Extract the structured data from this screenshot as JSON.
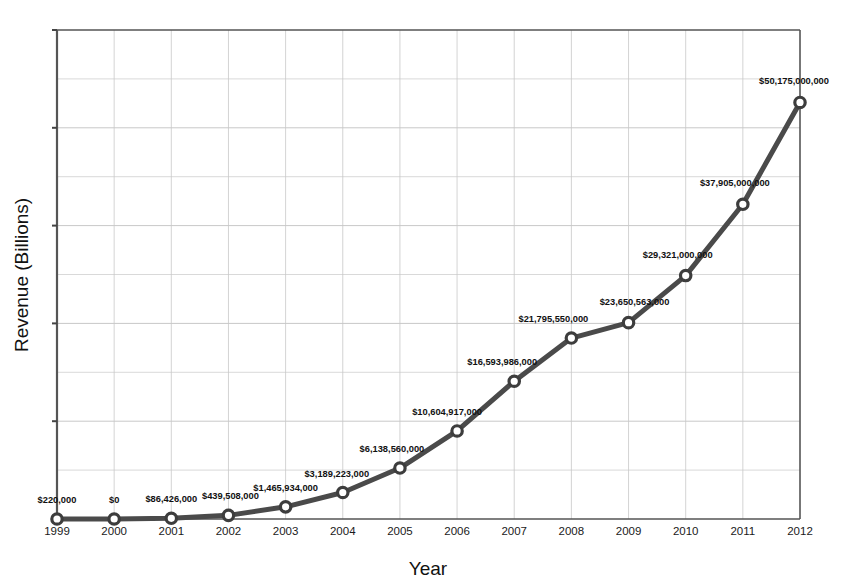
{
  "chart_data": {
    "type": "line",
    "title": "",
    "xlabel": "Year",
    "ylabel": "Revenue (Billions)",
    "categories": [
      "1999",
      "2000",
      "2001",
      "2002",
      "2003",
      "2004",
      "2005",
      "2006",
      "2007",
      "2008",
      "2009",
      "2010",
      "2011",
      "2012"
    ],
    "values": [
      220000,
      0,
      86426000,
      439508000,
      1465934000,
      3189223000,
      6138560000,
      10604917000,
      16593986000,
      21795550000,
      23650563000,
      29321000000,
      37905000000,
      50175000000
    ],
    "point_labels": [
      "$220,000",
      "$0",
      "$86,426,000",
      "$439,508,000",
      "$1,465,934,000",
      "$3,189,223,000",
      "$6,138,560,000",
      "$10,604,917,000",
      "$16,593,986,000",
      "$21,795,550,000",
      "$23,650,563,000",
      "$29,321,000,000",
      "$37,905,000,000",
      "$50,175,000,000"
    ],
    "xlim": [
      1999,
      2012
    ],
    "ylim": [
      0,
      58900000000
    ],
    "grid": true,
    "legend": false,
    "series_color": "#4a4a4a",
    "marker_fill": "#ffffff",
    "marker_edge": "#3d3d3d",
    "grid_color": "#c8c8c8",
    "axis_color": "#555555"
  },
  "axis": {
    "x_tick_labels": [
      "1999",
      "2000",
      "2001",
      "2002",
      "2003",
      "2004",
      "2005",
      "2006",
      "2007",
      "2008",
      "2009",
      "2010",
      "2011",
      "2012"
    ],
    "y_tick_labels": []
  }
}
